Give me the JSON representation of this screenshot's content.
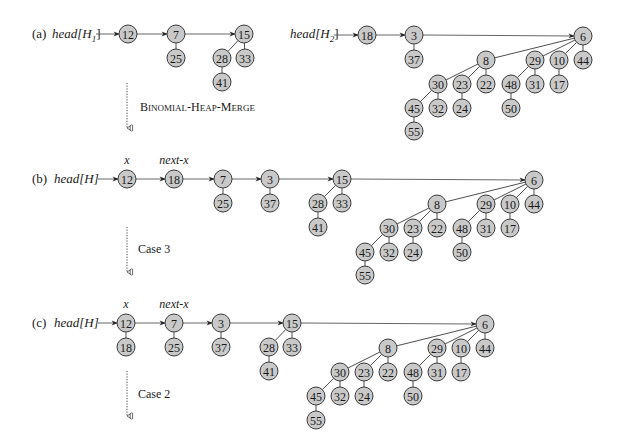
{
  "figure": {
    "node_color": "#c9c9c9",
    "stroke_color": "#3a3a3a",
    "node_radius": 9
  },
  "panels": [
    {
      "id": "a",
      "label": "(a)",
      "label_pos": [
        32,
        38
      ],
      "heads": [
        {
          "text": "head[H",
          "sub": "1",
          "close": "]",
          "pos": [
            52,
            38
          ],
          "arrow_from": [
            96,
            34
          ],
          "arrow_to_node": "a12"
        },
        {
          "text": "head[H",
          "sub": "2",
          "close": "]",
          "pos": [
            290,
            38
          ],
          "arrow_from": [
            334,
            35
          ],
          "arrow_to_node": "a18"
        }
      ],
      "nodes": [
        {
          "id": "a12",
          "key": "12",
          "x": 128,
          "y": 34
        },
        {
          "id": "a7",
          "key": "7",
          "x": 176,
          "y": 34
        },
        {
          "id": "a25",
          "key": "25",
          "x": 176,
          "y": 58
        },
        {
          "id": "a15",
          "key": "15",
          "x": 244,
          "y": 34
        },
        {
          "id": "a28",
          "key": "28",
          "x": 222,
          "y": 58
        },
        {
          "id": "a33",
          "key": "33",
          "x": 245,
          "y": 58
        },
        {
          "id": "a41",
          "key": "41",
          "x": 222,
          "y": 82
        },
        {
          "id": "a18",
          "key": "18",
          "x": 367,
          "y": 35
        },
        {
          "id": "a3",
          "key": "3",
          "x": 414,
          "y": 35
        },
        {
          "id": "a37",
          "key": "37",
          "x": 414,
          "y": 59
        },
        {
          "id": "a6",
          "key": "6",
          "x": 583,
          "y": 36
        },
        {
          "id": "a8",
          "key": "8",
          "x": 486,
          "y": 60
        },
        {
          "id": "a29",
          "key": "29",
          "x": 535,
          "y": 60
        },
        {
          "id": "a10",
          "key": "10",
          "x": 559,
          "y": 60
        },
        {
          "id": "a44",
          "key": "44",
          "x": 583,
          "y": 60
        },
        {
          "id": "a30",
          "key": "30",
          "x": 438,
          "y": 84
        },
        {
          "id": "a23",
          "key": "23",
          "x": 462,
          "y": 84
        },
        {
          "id": "a22",
          "key": "22",
          "x": 486,
          "y": 84
        },
        {
          "id": "a48",
          "key": "48",
          "x": 511,
          "y": 84
        },
        {
          "id": "a31",
          "key": "31",
          "x": 535,
          "y": 84
        },
        {
          "id": "a17",
          "key": "17",
          "x": 559,
          "y": 84
        },
        {
          "id": "a45",
          "key": "45",
          "x": 414,
          "y": 108
        },
        {
          "id": "a32",
          "key": "32",
          "x": 438,
          "y": 108
        },
        {
          "id": "a24",
          "key": "24",
          "x": 462,
          "y": 108
        },
        {
          "id": "a50",
          "key": "50",
          "x": 511,
          "y": 108
        },
        {
          "id": "a55",
          "key": "55",
          "x": 414,
          "y": 131
        }
      ],
      "root_links": [
        [
          "a12",
          "a7"
        ],
        [
          "a7",
          "a15"
        ],
        [
          "a18",
          "a3"
        ],
        [
          "a3",
          "a6"
        ]
      ],
      "tree_edges": [
        [
          "a7",
          "a25"
        ],
        [
          "a15",
          "a28"
        ],
        [
          "a15",
          "a33"
        ],
        [
          "a28",
          "a41"
        ],
        [
          "a3",
          "a37"
        ],
        [
          "a6",
          "a8"
        ],
        [
          "a6",
          "a29"
        ],
        [
          "a6",
          "a10"
        ],
        [
          "a6",
          "a44"
        ],
        [
          "a8",
          "a30"
        ],
        [
          "a8",
          "a23"
        ],
        [
          "a8",
          "a22"
        ],
        [
          "a29",
          "a48"
        ],
        [
          "a29",
          "a31"
        ],
        [
          "a10",
          "a17"
        ],
        [
          "a30",
          "a45"
        ],
        [
          "a30",
          "a32"
        ],
        [
          "a23",
          "a24"
        ],
        [
          "a48",
          "a50"
        ],
        [
          "a45",
          "a55"
        ]
      ],
      "pointers": [],
      "step": {
        "label": "Binomial-Heap-Merge",
        "arrow_x": 127,
        "arrow_y1": 83,
        "arrow_y2": 128,
        "label_pos": [
          140,
          111
        ],
        "smallcaps": true
      }
    },
    {
      "id": "b",
      "label": "(b)",
      "label_pos": [
        32,
        183
      ],
      "heads": [
        {
          "text": "head[H]",
          "sub": "",
          "close": "",
          "pos": [
            54,
            183
          ],
          "arrow_from": [
            98,
            179
          ],
          "arrow_to_node": "b12"
        }
      ],
      "nodes": [
        {
          "id": "b12",
          "key": "12",
          "x": 127,
          "y": 179
        },
        {
          "id": "b18",
          "key": "18",
          "x": 174,
          "y": 179
        },
        {
          "id": "b7",
          "key": "7",
          "x": 223,
          "y": 179
        },
        {
          "id": "b25",
          "key": "25",
          "x": 223,
          "y": 203
        },
        {
          "id": "b3",
          "key": "3",
          "x": 270,
          "y": 179
        },
        {
          "id": "b37",
          "key": "37",
          "x": 270,
          "y": 203
        },
        {
          "id": "b15",
          "key": "15",
          "x": 342,
          "y": 179
        },
        {
          "id": "b28",
          "key": "28",
          "x": 318,
          "y": 203
        },
        {
          "id": "b33",
          "key": "33",
          "x": 342,
          "y": 203
        },
        {
          "id": "b41",
          "key": "41",
          "x": 318,
          "y": 227
        },
        {
          "id": "b6",
          "key": "6",
          "x": 534,
          "y": 180
        },
        {
          "id": "b8",
          "key": "8",
          "x": 437,
          "y": 204
        },
        {
          "id": "b29",
          "key": "29",
          "x": 486,
          "y": 204
        },
        {
          "id": "b10",
          "key": "10",
          "x": 510,
          "y": 204
        },
        {
          "id": "b44",
          "key": "44",
          "x": 534,
          "y": 204
        },
        {
          "id": "b30",
          "key": "30",
          "x": 389,
          "y": 228
        },
        {
          "id": "b23",
          "key": "23",
          "x": 413,
          "y": 228
        },
        {
          "id": "b22",
          "key": "22",
          "x": 437,
          "y": 228
        },
        {
          "id": "b48",
          "key": "48",
          "x": 462,
          "y": 228
        },
        {
          "id": "b31",
          "key": "31",
          "x": 486,
          "y": 228
        },
        {
          "id": "b17",
          "key": "17",
          "x": 510,
          "y": 228
        },
        {
          "id": "b45",
          "key": "45",
          "x": 365,
          "y": 252
        },
        {
          "id": "b32",
          "key": "32",
          "x": 389,
          "y": 252
        },
        {
          "id": "b24",
          "key": "24",
          "x": 413,
          "y": 252
        },
        {
          "id": "b50",
          "key": "50",
          "x": 462,
          "y": 252
        },
        {
          "id": "b55",
          "key": "55",
          "x": 365,
          "y": 275
        }
      ],
      "root_links": [
        [
          "b12",
          "b18"
        ],
        [
          "b18",
          "b7"
        ],
        [
          "b7",
          "b3"
        ],
        [
          "b3",
          "b15"
        ],
        [
          "b15",
          "b6"
        ]
      ],
      "tree_edges": [
        [
          "b7",
          "b25"
        ],
        [
          "b3",
          "b37"
        ],
        [
          "b15",
          "b28"
        ],
        [
          "b15",
          "b33"
        ],
        [
          "b28",
          "b41"
        ],
        [
          "b6",
          "b8"
        ],
        [
          "b6",
          "b29"
        ],
        [
          "b6",
          "b10"
        ],
        [
          "b6",
          "b44"
        ],
        [
          "b8",
          "b30"
        ],
        [
          "b8",
          "b23"
        ],
        [
          "b8",
          "b22"
        ],
        [
          "b29",
          "b48"
        ],
        [
          "b29",
          "b31"
        ],
        [
          "b10",
          "b17"
        ],
        [
          "b30",
          "b45"
        ],
        [
          "b30",
          "b32"
        ],
        [
          "b23",
          "b24"
        ],
        [
          "b48",
          "b50"
        ],
        [
          "b45",
          "b55"
        ]
      ],
      "pointers": [
        {
          "text": "x",
          "x": 127,
          "y": 164
        },
        {
          "text": "next-x",
          "x": 174,
          "y": 164
        }
      ],
      "step": {
        "label": "Case 3",
        "arrow_x": 127,
        "arrow_y1": 227,
        "arrow_y2": 272,
        "label_pos": [
          138,
          253
        ],
        "smallcaps": false
      }
    },
    {
      "id": "c",
      "label": "(c)",
      "label_pos": [
        32,
        327
      ],
      "heads": [
        {
          "text": "head[H]",
          "sub": "",
          "close": "",
          "pos": [
            54,
            327
          ],
          "arrow_from": [
            98,
            323
          ],
          "arrow_to_node": "c12"
        }
      ],
      "nodes": [
        {
          "id": "c12",
          "key": "12",
          "x": 126,
          "y": 323
        },
        {
          "id": "c18",
          "key": "18",
          "x": 126,
          "y": 347
        },
        {
          "id": "c7",
          "key": "7",
          "x": 174,
          "y": 323
        },
        {
          "id": "c25",
          "key": "25",
          "x": 174,
          "y": 347
        },
        {
          "id": "c3",
          "key": "3",
          "x": 221,
          "y": 323
        },
        {
          "id": "c37",
          "key": "37",
          "x": 221,
          "y": 347
        },
        {
          "id": "c15",
          "key": "15",
          "x": 292,
          "y": 323
        },
        {
          "id": "c28",
          "key": "28",
          "x": 269,
          "y": 347
        },
        {
          "id": "c33",
          "key": "33",
          "x": 292,
          "y": 347
        },
        {
          "id": "c41",
          "key": "41",
          "x": 269,
          "y": 371
        },
        {
          "id": "c6",
          "key": "6",
          "x": 485,
          "y": 324
        },
        {
          "id": "c8",
          "key": "8",
          "x": 388,
          "y": 348
        },
        {
          "id": "c29",
          "key": "29",
          "x": 437,
          "y": 348
        },
        {
          "id": "c10",
          "key": "10",
          "x": 461,
          "y": 348
        },
        {
          "id": "c44",
          "key": "44",
          "x": 485,
          "y": 348
        },
        {
          "id": "c30",
          "key": "30",
          "x": 340,
          "y": 372
        },
        {
          "id": "c23",
          "key": "23",
          "x": 364,
          "y": 372
        },
        {
          "id": "c22",
          "key": "22",
          "x": 388,
          "y": 372
        },
        {
          "id": "c48",
          "key": "48",
          "x": 413,
          "y": 372
        },
        {
          "id": "c31",
          "key": "31",
          "x": 437,
          "y": 372
        },
        {
          "id": "c17",
          "key": "17",
          "x": 461,
          "y": 372
        },
        {
          "id": "c45",
          "key": "45",
          "x": 316,
          "y": 396
        },
        {
          "id": "c32",
          "key": "32",
          "x": 340,
          "y": 396
        },
        {
          "id": "c24",
          "key": "24",
          "x": 364,
          "y": 396
        },
        {
          "id": "c50",
          "key": "50",
          "x": 413,
          "y": 396
        },
        {
          "id": "c55",
          "key": "55",
          "x": 316,
          "y": 420
        }
      ],
      "root_links": [
        [
          "c12",
          "c7"
        ],
        [
          "c7",
          "c3"
        ],
        [
          "c3",
          "c15"
        ],
        [
          "c15",
          "c6"
        ]
      ],
      "tree_edges": [
        [
          "c12",
          "c18"
        ],
        [
          "c7",
          "c25"
        ],
        [
          "c3",
          "c37"
        ],
        [
          "c15",
          "c28"
        ],
        [
          "c15",
          "c33"
        ],
        [
          "c28",
          "c41"
        ],
        [
          "c6",
          "c8"
        ],
        [
          "c6",
          "c29"
        ],
        [
          "c6",
          "c10"
        ],
        [
          "c6",
          "c44"
        ],
        [
          "c8",
          "c30"
        ],
        [
          "c8",
          "c23"
        ],
        [
          "c8",
          "c22"
        ],
        [
          "c29",
          "c48"
        ],
        [
          "c29",
          "c31"
        ],
        [
          "c10",
          "c17"
        ],
        [
          "c30",
          "c45"
        ],
        [
          "c30",
          "c32"
        ],
        [
          "c23",
          "c24"
        ],
        [
          "c48",
          "c50"
        ],
        [
          "c45",
          "c55"
        ]
      ],
      "pointers": [
        {
          "text": "x",
          "x": 126,
          "y": 308
        },
        {
          "text": "next-x",
          "x": 174,
          "y": 308
        }
      ],
      "step": {
        "label": "Case 2",
        "arrow_x": 127,
        "arrow_y1": 371,
        "arrow_y2": 416,
        "label_pos": [
          138,
          398
        ],
        "smallcaps": false
      }
    }
  ]
}
